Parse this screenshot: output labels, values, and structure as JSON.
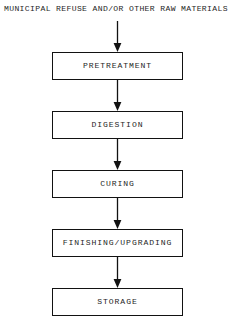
{
  "diagram": {
    "type": "flowchart",
    "orientation": "vertical-top-down",
    "title": "MUNICIPAL REFUSE AND/OR OTHER RAW MATERIALS",
    "background_color": "#ffffff",
    "line_color": "#121212",
    "text_color": "#1f1f1f",
    "input_label": "MUNICIPAL REFUSE AND/OR OTHER RAW MATERIALS",
    "steps": [
      {
        "label": "PRETREATMENT"
      },
      {
        "label": "DIGESTION"
      },
      {
        "label": "CURING"
      },
      {
        "label": "FINISHING/UPGRADING"
      },
      {
        "label": "STORAGE"
      }
    ],
    "connectors": [
      {
        "from": "MUNICIPAL REFUSE AND/OR OTHER RAW MATERIALS",
        "to": "PRETREATMENT"
      },
      {
        "from": "PRETREATMENT",
        "to": "DIGESTION"
      },
      {
        "from": "DIGESTION",
        "to": "CURING"
      },
      {
        "from": "CURING",
        "to": "FINISHING/UPGRADING"
      },
      {
        "from": "FINISHING/UPGRADING",
        "to": "STORAGE"
      }
    ]
  }
}
